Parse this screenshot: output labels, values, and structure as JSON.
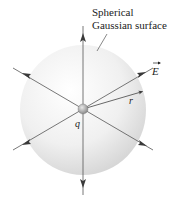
{
  "figure": {
    "surface_label_line1": "Spherical",
    "surface_label_line2": "Gaussian surface",
    "field_label": "E",
    "radius_label": "r",
    "charge_label": "q"
  },
  "colors": {
    "line": "#4a4a4a",
    "sphere_light": "#f7f7f7",
    "sphere_dark": "#d6d6d6",
    "charge": "#9a9a9a"
  }
}
